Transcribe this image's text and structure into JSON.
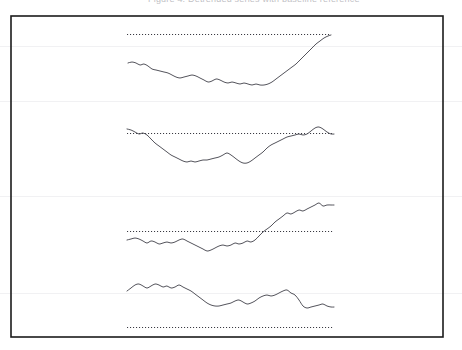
{
  "caption": {
    "text": "Figure 4.  Detrended series with baseline reference"
  },
  "figure": {
    "title": "",
    "frame": {
      "x": 11,
      "y": 16,
      "width": 432,
      "height": 321,
      "stroke": "#1b1b1b",
      "stroke_width": 1.6
    },
    "background": "#ffffff",
    "curve_color": "#4a4a52",
    "reference_color": "#3a3a42",
    "scanlines": [
      46,
      101,
      196,
      293
    ]
  },
  "chart_data": {
    "type": "line",
    "title": "Detrended series with baseline reference",
    "xlabel": "",
    "ylabel": "",
    "grid": false,
    "legend": "none",
    "axis_ticks": false,
    "panel_count": 4,
    "x": [
      0,
      4,
      8,
      12,
      16,
      20,
      24,
      28,
      32,
      36,
      40,
      44,
      48,
      52,
      56,
      60,
      64,
      68,
      72,
      76,
      80,
      84,
      88,
      92,
      96,
      100
    ],
    "xlim": [
      0,
      100
    ],
    "panels": [
      {
        "name": "panel-1",
        "reference_line": {
          "value": 34,
          "x_start": 127,
          "x_end": 331,
          "style": "dotted"
        },
        "series": {
          "name": "trace-1",
          "x_start": 128,
          "x_end": 331,
          "points": [
            [
              128,
              63
            ],
            [
              132,
              62
            ],
            [
              136,
              63
            ],
            [
              140,
              65
            ],
            [
              144,
              64
            ],
            [
              148,
              66
            ],
            [
              152,
              69
            ],
            [
              156,
              70
            ],
            [
              160,
              71
            ],
            [
              164,
              72
            ],
            [
              168,
              73
            ],
            [
              172,
              75
            ],
            [
              176,
              77
            ],
            [
              180,
              78
            ],
            [
              184,
              77
            ],
            [
              188,
              76
            ],
            [
              192,
              75
            ],
            [
              196,
              76
            ],
            [
              200,
              78
            ],
            [
              204,
              80
            ],
            [
              208,
              82
            ],
            [
              212,
              81
            ],
            [
              216,
              79
            ],
            [
              220,
              80
            ],
            [
              224,
              82
            ],
            [
              228,
              83
            ],
            [
              232,
              82
            ],
            [
              236,
              83
            ],
            [
              240,
              84
            ],
            [
              244,
              83
            ],
            [
              248,
              84
            ],
            [
              252,
              85
            ],
            [
              256,
              84
            ],
            [
              260,
              85
            ],
            [
              264,
              85
            ],
            [
              268,
              84
            ],
            [
              272,
              82
            ],
            [
              276,
              79
            ],
            [
              280,
              76
            ],
            [
              284,
              73
            ],
            [
              288,
              70
            ],
            [
              292,
              67
            ],
            [
              296,
              64
            ],
            [
              300,
              60
            ],
            [
              304,
              56
            ],
            [
              308,
              52
            ],
            [
              312,
              48
            ],
            [
              316,
              44
            ],
            [
              320,
              41
            ],
            [
              324,
              38
            ],
            [
              328,
              36
            ],
            [
              331,
              35
            ]
          ]
        }
      },
      {
        "name": "panel-2",
        "reference_line": {
          "value": 133,
          "x_start": 127,
          "x_end": 334,
          "style": "dotted"
        },
        "series": {
          "name": "trace-2",
          "x_start": 127,
          "x_end": 334,
          "points": [
            [
              127,
              129
            ],
            [
              131,
              130
            ],
            [
              135,
              132
            ],
            [
              139,
              134
            ],
            [
              143,
              133
            ],
            [
              147,
              135
            ],
            [
              151,
              139
            ],
            [
              155,
              143
            ],
            [
              159,
              146
            ],
            [
              163,
              149
            ],
            [
              167,
              152
            ],
            [
              171,
              155
            ],
            [
              175,
              157
            ],
            [
              179,
              159
            ],
            [
              183,
              161
            ],
            [
              187,
              162
            ],
            [
              191,
              161
            ],
            [
              195,
              162
            ],
            [
              199,
              161
            ],
            [
              203,
              160
            ],
            [
              207,
              160
            ],
            [
              211,
              159
            ],
            [
              215,
              158
            ],
            [
              219,
              157
            ],
            [
              223,
              155
            ],
            [
              227,
              153
            ],
            [
              231,
              155
            ],
            [
              235,
              158
            ],
            [
              239,
              161
            ],
            [
              243,
              163
            ],
            [
              247,
              163
            ],
            [
              251,
              161
            ],
            [
              255,
              158
            ],
            [
              259,
              155
            ],
            [
              263,
              152
            ],
            [
              267,
              148
            ],
            [
              271,
              145
            ],
            [
              275,
              143
            ],
            [
              279,
              141
            ],
            [
              283,
              139
            ],
            [
              287,
              137
            ],
            [
              291,
              136
            ],
            [
              295,
              135
            ],
            [
              299,
              134
            ],
            [
              303,
              135
            ],
            [
              307,
              134
            ],
            [
              311,
              131
            ],
            [
              315,
              128
            ],
            [
              319,
              127
            ],
            [
              323,
              129
            ],
            [
              327,
              132
            ],
            [
              331,
              134
            ],
            [
              334,
              134
            ]
          ]
        }
      },
      {
        "name": "panel-3",
        "reference_line": {
          "value": 231,
          "x_start": 127,
          "x_end": 334,
          "style": "dotted"
        },
        "series": {
          "name": "trace-3",
          "x_start": 127,
          "x_end": 334,
          "points": [
            [
              127,
              240
            ],
            [
              131,
              239
            ],
            [
              135,
              238
            ],
            [
              139,
              239
            ],
            [
              143,
              241
            ],
            [
              147,
              243
            ],
            [
              151,
              241
            ],
            [
              155,
              242
            ],
            [
              159,
              244
            ],
            [
              163,
              243
            ],
            [
              167,
              242
            ],
            [
              171,
              243
            ],
            [
              175,
              242
            ],
            [
              179,
              240
            ],
            [
              183,
              239
            ],
            [
              187,
              241
            ],
            [
              191,
              243
            ],
            [
              195,
              245
            ],
            [
              199,
              247
            ],
            [
              203,
              249
            ],
            [
              207,
              251
            ],
            [
              211,
              250
            ],
            [
              215,
              248
            ],
            [
              219,
              246
            ],
            [
              223,
              245
            ],
            [
              227,
              246
            ],
            [
              231,
              245
            ],
            [
              235,
              243
            ],
            [
              239,
              244
            ],
            [
              243,
              243
            ],
            [
              247,
              241
            ],
            [
              251,
              242
            ],
            [
              255,
              240
            ],
            [
              259,
              236
            ],
            [
              263,
              232
            ],
            [
              267,
              229
            ],
            [
              271,
              226
            ],
            [
              275,
              222
            ],
            [
              279,
              219
            ],
            [
              283,
              216
            ],
            [
              287,
              213
            ],
            [
              291,
              214
            ],
            [
              295,
              212
            ],
            [
              299,
              210
            ],
            [
              303,
              211
            ],
            [
              307,
              209
            ],
            [
              311,
              207
            ],
            [
              315,
              205
            ],
            [
              319,
              203
            ],
            [
              323,
              206
            ],
            [
              327,
              205
            ],
            [
              331,
              205
            ],
            [
              334,
              205
            ]
          ]
        }
      },
      {
        "name": "panel-4",
        "reference_line": {
          "value": 327,
          "x_start": 127,
          "x_end": 334,
          "style": "dotted"
        },
        "series": {
          "name": "trace-4",
          "x_start": 127,
          "x_end": 334,
          "points": [
            [
              127,
              291
            ],
            [
              131,
              288
            ],
            [
              135,
              285
            ],
            [
              139,
              284
            ],
            [
              143,
              286
            ],
            [
              147,
              288
            ],
            [
              151,
              286
            ],
            [
              155,
              284
            ],
            [
              159,
              285
            ],
            [
              163,
              287
            ],
            [
              167,
              286
            ],
            [
              171,
              288
            ],
            [
              175,
              287
            ],
            [
              179,
              285
            ],
            [
              183,
              287
            ],
            [
              187,
              289
            ],
            [
              191,
              291
            ],
            [
              195,
              294
            ],
            [
              199,
              297
            ],
            [
              203,
              300
            ],
            [
              207,
              303
            ],
            [
              211,
              305
            ],
            [
              215,
              306
            ],
            [
              219,
              306
            ],
            [
              223,
              305
            ],
            [
              227,
              304
            ],
            [
              231,
              303
            ],
            [
              235,
              301
            ],
            [
              239,
              300
            ],
            [
              243,
              302
            ],
            [
              247,
              304
            ],
            [
              251,
              303
            ],
            [
              255,
              301
            ],
            [
              259,
              298
            ],
            [
              263,
              296
            ],
            [
              267,
              295
            ],
            [
              271,
              296
            ],
            [
              275,
              295
            ],
            [
              279,
              293
            ],
            [
              283,
              291
            ],
            [
              287,
              290
            ],
            [
              291,
              293
            ],
            [
              295,
              295
            ],
            [
              299,
              300
            ],
            [
              303,
              306
            ],
            [
              307,
              308
            ],
            [
              311,
              307
            ],
            [
              315,
              306
            ],
            [
              319,
              305
            ],
            [
              323,
              304
            ],
            [
              327,
              306
            ],
            [
              331,
              307
            ],
            [
              334,
              307
            ]
          ]
        }
      }
    ]
  }
}
